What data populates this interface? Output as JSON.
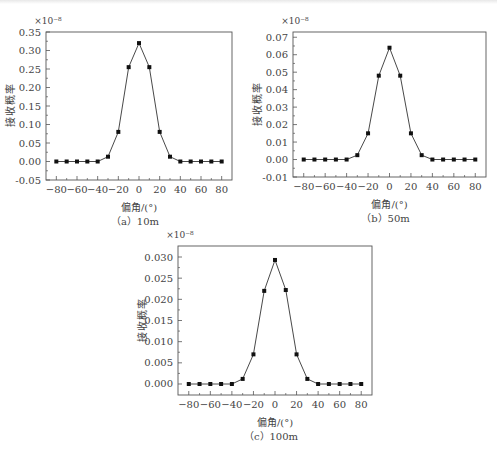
{
  "chart_data": [
    {
      "id": "a",
      "type": "line",
      "title": "",
      "caption": "（a）10m",
      "xlabel": "偏角/(°)",
      "ylabel": "接收概率",
      "y_multiplier": "×10⁻⁸",
      "x": [
        -80,
        -70,
        -60,
        -50,
        -40,
        -30,
        -20,
        -10,
        0,
        10,
        20,
        30,
        40,
        50,
        60,
        70,
        80
      ],
      "values": [
        0,
        0,
        0,
        0,
        0,
        0.013,
        0.08,
        0.255,
        0.32,
        0.255,
        0.08,
        0.013,
        0,
        0,
        0,
        0,
        0
      ],
      "xlim": [
        -90,
        90
      ],
      "ylim": [
        -0.05,
        0.35
      ],
      "xticks": [
        -80,
        -60,
        -40,
        -20,
        0,
        20,
        40,
        60,
        80
      ],
      "yticks": [
        -0.05,
        0.0,
        0.05,
        0.1,
        0.15,
        0.2,
        0.25,
        0.3,
        0.35
      ],
      "ytick_labels": [
        "-0.05",
        "0.00",
        "0.05",
        "0.10",
        "0.15",
        "0.20",
        "0.25",
        "0.30",
        "0.35"
      ],
      "grid": false,
      "marker": "square"
    },
    {
      "id": "b",
      "type": "line",
      "title": "",
      "caption": "（b）50m",
      "xlabel": "偏角/(°)",
      "ylabel": "接收概率",
      "y_multiplier": "×10⁻⁸",
      "x": [
        -80,
        -70,
        -60,
        -50,
        -40,
        -30,
        -20,
        -10,
        0,
        10,
        20,
        30,
        40,
        50,
        60,
        70,
        80
      ],
      "values": [
        0,
        0,
        0,
        0,
        0,
        0.0025,
        0.015,
        0.048,
        0.064,
        0.048,
        0.015,
        0.0025,
        0,
        0,
        0,
        0,
        0
      ],
      "xlim": [
        -90,
        90
      ],
      "ylim": [
        -0.01,
        0.073
      ],
      "xticks": [
        -80,
        -60,
        -40,
        -20,
        0,
        20,
        40,
        60,
        80
      ],
      "yticks": [
        -0.01,
        0.0,
        0.01,
        0.02,
        0.03,
        0.04,
        0.05,
        0.06,
        0.07
      ],
      "ytick_labels": [
        "-0.01",
        "0.00",
        "0.01",
        "0.02",
        "0.03",
        "0.04",
        "0.05",
        "0.06",
        "0.07"
      ],
      "grid": false,
      "marker": "square"
    },
    {
      "id": "c",
      "type": "line",
      "title": "",
      "caption": "（c）100m",
      "xlabel": "偏角/(°)",
      "ylabel": "接收概率",
      "y_multiplier": "×10⁻⁸",
      "x": [
        -80,
        -70,
        -60,
        -50,
        -40,
        -30,
        -20,
        -10,
        0,
        10,
        20,
        30,
        40,
        50,
        60,
        70,
        80
      ],
      "values": [
        0,
        0,
        0,
        0,
        0,
        0.0012,
        0.007,
        0.022,
        0.0293,
        0.0222,
        0.007,
        0.0012,
        0,
        0,
        0,
        0,
        0
      ],
      "xlim": [
        -90,
        90
      ],
      "ylim": [
        -0.0026,
        0.0326
      ],
      "xticks": [
        -80,
        -60,
        -40,
        -20,
        0,
        20,
        40,
        60,
        80
      ],
      "yticks": [
        0.0,
        0.005,
        0.01,
        0.015,
        0.02,
        0.025,
        0.03
      ],
      "ytick_labels": [
        "0.000",
        "0.005",
        "0.010",
        "0.015",
        "0.020",
        "0.025",
        "0.030"
      ],
      "grid": false,
      "marker": "square"
    }
  ],
  "layout": {
    "charts": [
      {
        "left": 46,
        "top": 32,
        "right": 232,
        "bottom": 180
      },
      {
        "left": 293,
        "top": 32,
        "right": 486,
        "bottom": 177
      },
      {
        "left": 178,
        "top": 246,
        "right": 372,
        "bottom": 395
      }
    ]
  }
}
